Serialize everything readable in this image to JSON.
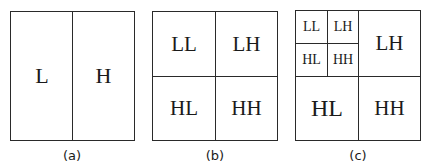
{
  "panels": [
    {
      "caption": "(a)",
      "cells": [
        "L",
        "H"
      ]
    },
    {
      "caption": "(b)",
      "cells": [
        "LL",
        "LH",
        "HL",
        "HH"
      ]
    },
    {
      "caption": "(c)",
      "sub_cells": [
        "LL",
        "LH",
        "HL",
        "HH"
      ],
      "cells": [
        "LH",
        "HL",
        "HH"
      ]
    }
  ]
}
